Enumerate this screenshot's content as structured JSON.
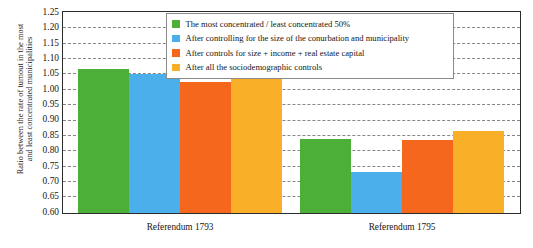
{
  "chart_data": {
    "type": "bar",
    "title": "",
    "xlabel": "",
    "ylabel": "Ratio between the rate of turnout in the most and least concentrated municipalities",
    "ylabel_lines": [
      "Ratio between the rate of turnout in the most",
      "and least concentrated municipalities"
    ],
    "categories": [
      "Referendum 1793",
      "Referendum 1795"
    ],
    "ylim": [
      0.6,
      1.25
    ],
    "ytick_labels": [
      "1.25",
      "1.20",
      "1.15",
      "1.10",
      "1.05",
      "1.00",
      "0.95",
      "0.90",
      "0.85",
      "0.80",
      "0.75",
      "0.70",
      "0.65",
      "0.60"
    ],
    "ytick_values": [
      1.25,
      1.2,
      1.15,
      1.1,
      1.05,
      1.0,
      0.95,
      0.9,
      0.85,
      0.8,
      0.75,
      0.7,
      0.65,
      0.6
    ],
    "grid": true,
    "legend_position": "upper center",
    "series": [
      {
        "name": "The most concentrated / least concentrated 50%",
        "color": "#4CAF38",
        "values": [
          1.07,
          0.84
        ]
      },
      {
        "name": "After controlling for the size of the conurbation and municipality",
        "color": "#4BAFEC",
        "values": [
          1.052,
          0.732
        ]
      },
      {
        "name": "After controls for size + income + real estate capital",
        "color": "#F4671C",
        "values": [
          1.025,
          0.838
        ]
      },
      {
        "name": "After all the sociodemographic controls",
        "color": "#F9AF28",
        "values": [
          1.045,
          0.866
        ]
      }
    ]
  },
  "legend": {
    "items": [
      {
        "label": "The most concentrated / least concentrated 50%",
        "color": "#4CAF38",
        "swatch_name": "legend-swatch-green"
      },
      {
        "label": "After controlling for the size of the conurbation and municipality",
        "color": "#4BAFEC",
        "swatch_name": "legend-swatch-blue"
      },
      {
        "label": "After controls for size + income + real estate capital",
        "color": "#F4671C",
        "swatch_name": "legend-swatch-orange"
      },
      {
        "label": "After all the sociodemographic controls",
        "color": "#F9AF28",
        "swatch_name": "legend-swatch-amber"
      }
    ]
  }
}
